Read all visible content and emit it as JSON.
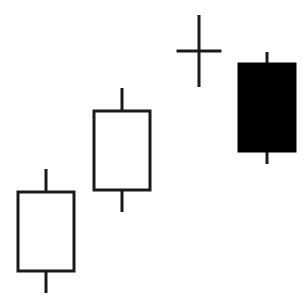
{
  "chart_data": {
    "type": "candlestick",
    "title": "",
    "xlabel": "",
    "ylabel": "",
    "grid": false,
    "legend": null,
    "axes_visible": false,
    "ylim": [
      0,
      308
    ],
    "categories": [
      "1",
      "2",
      "3",
      "4"
    ],
    "candles": [
      {
        "label": "1",
        "open": 37,
        "high": 139,
        "low": 15,
        "close": 116,
        "direction": "bullish",
        "style": "hollow"
      },
      {
        "label": "2",
        "open": 118,
        "high": 220,
        "low": 96,
        "close": 197,
        "direction": "bullish",
        "style": "hollow"
      },
      {
        "label": "3",
        "open": 257,
        "high": 293,
        "low": 221,
        "close": 257,
        "direction": "doji",
        "style": "cross"
      },
      {
        "label": "4",
        "open": 244,
        "high": 256,
        "low": 144,
        "close": 157,
        "direction": "bearish",
        "style": "filled"
      }
    ],
    "colors": {
      "stroke": "#1a1a1a",
      "bullish_fill": "#ffffff",
      "bearish_fill": "#000000",
      "background": "#ffffff"
    }
  },
  "layout": {
    "candle_centers_x": [
      46,
      122,
      199,
      267
    ],
    "body_width": 56,
    "doji_width": 45,
    "stroke_width": 3
  }
}
